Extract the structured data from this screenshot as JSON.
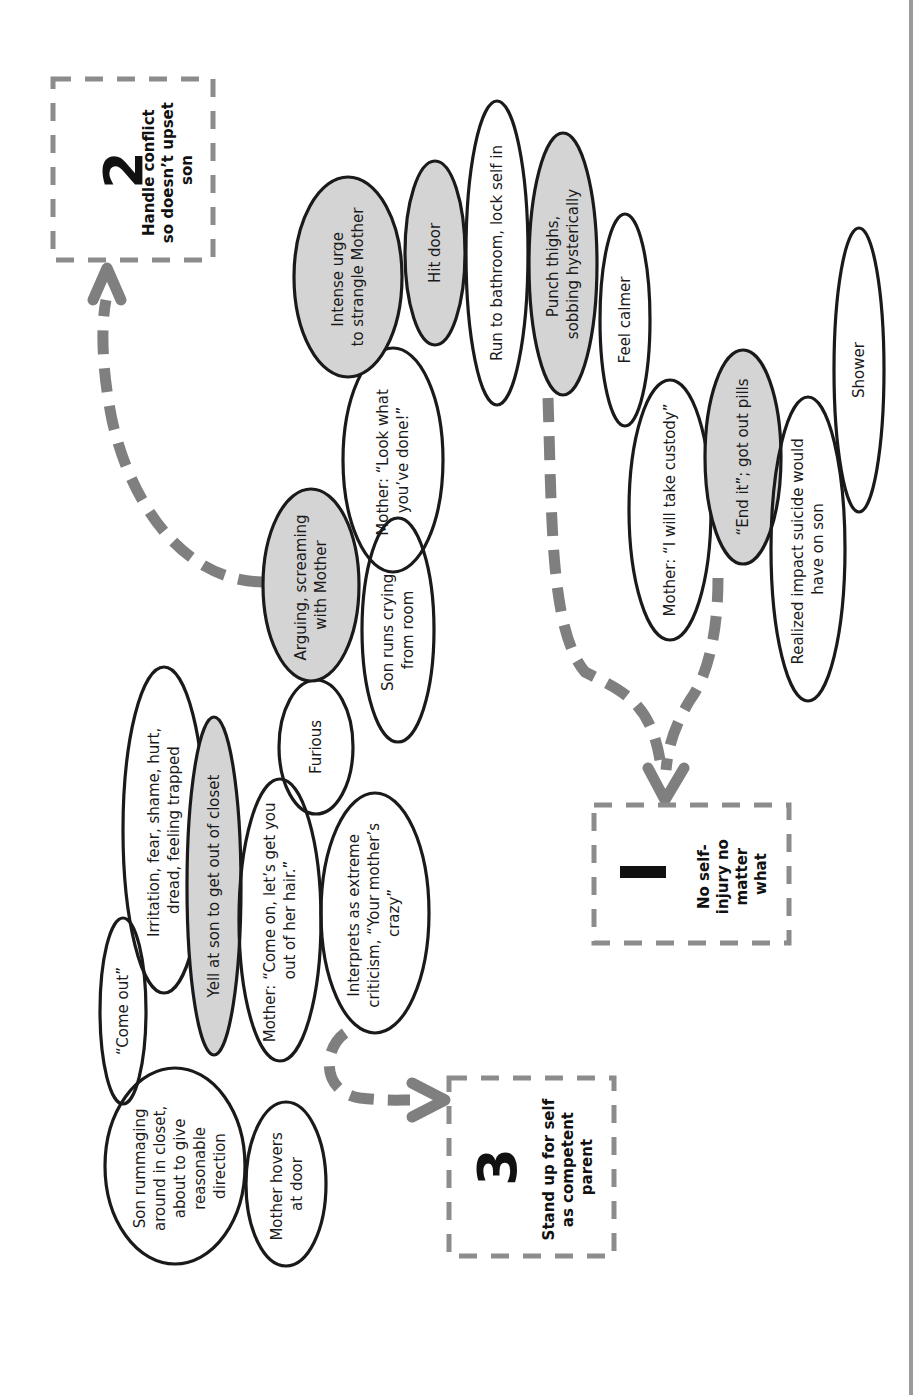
{
  "diagram": {
    "orientation": "rotated 90 degrees counter-clockwise; text reads bottom-to-top",
    "colors": {
      "highlighted_node_fill": "#d4d4d4",
      "node_stroke": "#1a1a1a",
      "arrow": "#7f7f7f",
      "goal_box_border": "#8c8c8c"
    },
    "nodes": [
      {
        "id": "n1",
        "lines": [
          "Son rummaging",
          "around in closet,",
          "about to give",
          "reasonable",
          "direction"
        ],
        "highlighted": false
      },
      {
        "id": "n2",
        "lines": [
          "Mother hovers",
          "at door"
        ],
        "highlighted": false
      },
      {
        "id": "n3",
        "lines": [
          "“Come out”"
        ],
        "highlighted": false
      },
      {
        "id": "n4",
        "lines": [
          "Irritation, fear, shame, hurt,",
          "dread, feeling trapped"
        ],
        "highlighted": false
      },
      {
        "id": "n5",
        "lines": [
          "Yell at son to get out of closet"
        ],
        "highlighted": true
      },
      {
        "id": "n6",
        "lines": [
          "Mother: “Come on, let’s get you",
          "out of her hair.”"
        ],
        "highlighted": false
      },
      {
        "id": "n7",
        "lines": [
          "Interprets as extreme",
          "criticism, “Your mother’s",
          "crazy”"
        ],
        "highlighted": false
      },
      {
        "id": "n8",
        "lines": [
          "Furious"
        ],
        "highlighted": false
      },
      {
        "id": "n9",
        "lines": [
          "Arguing, screaming",
          "with Mother"
        ],
        "highlighted": true
      },
      {
        "id": "n10",
        "lines": [
          "Son runs crying",
          "from room"
        ],
        "highlighted": false
      },
      {
        "id": "n11",
        "lines": [
          "Mother: “Look what",
          "you’ve done!”"
        ],
        "highlighted": false
      },
      {
        "id": "n12",
        "lines": [
          "Intense urge",
          "to strangle Mother"
        ],
        "highlighted": true
      },
      {
        "id": "n13",
        "lines": [
          "Hit door"
        ],
        "highlighted": true
      },
      {
        "id": "n14",
        "lines": [
          "Run to bathroom, lock self in"
        ],
        "highlighted": false
      },
      {
        "id": "n15",
        "lines": [
          "Punch thighs,",
          "sobbing hysterically"
        ],
        "highlighted": true
      },
      {
        "id": "n16",
        "lines": [
          "Feel calmer"
        ],
        "highlighted": false
      },
      {
        "id": "n17",
        "lines": [
          "Mother: “I will take custody”"
        ],
        "highlighted": false
      },
      {
        "id": "n18",
        "lines": [
          "“End it”; got out pills"
        ],
        "highlighted": true
      },
      {
        "id": "n19",
        "lines": [
          "Realized impact suicide would",
          "have on son"
        ],
        "highlighted": false
      },
      {
        "id": "n20",
        "lines": [
          "Shower"
        ],
        "highlighted": false
      }
    ],
    "goals": [
      {
        "id": "g1",
        "number": "1",
        "lines": [
          "No self-",
          "injury no",
          "matter",
          "what"
        ]
      },
      {
        "id": "g2",
        "number": "2",
        "lines": [
          "Handle conflict",
          "so doesn’t upset",
          "son"
        ]
      },
      {
        "id": "g3",
        "number": "3",
        "lines": [
          "Stand up for self",
          "as competent",
          "parent"
        ]
      }
    ],
    "arrows": [
      {
        "from": "n9",
        "to": "g2"
      },
      {
        "from": "n15",
        "to": "g1"
      },
      {
        "from": "n18",
        "to": "g1"
      },
      {
        "from": "n7",
        "to": "g3"
      }
    ]
  }
}
